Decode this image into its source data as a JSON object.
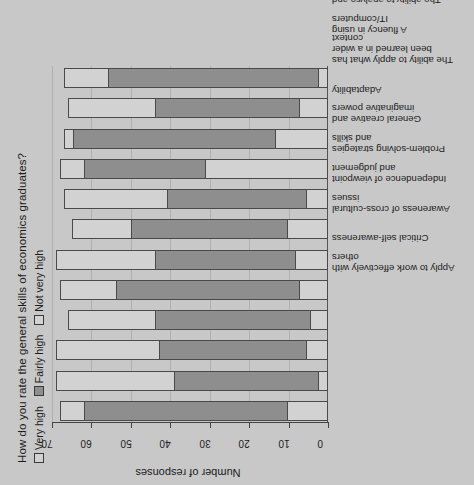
{
  "chart_data": {
    "type": "bar",
    "subtype": "stacked-horizontal",
    "title": "How do you rate the general skills of economics graduates?",
    "xlabel": "",
    "ylabel": "Number of responses",
    "axis_title": "Number of responses",
    "ylim": [
      0,
      70
    ],
    "ticks": [
      0,
      10,
      20,
      30,
      40,
      50,
      60,
      70
    ],
    "grid": true,
    "legend_position": "top-left",
    "legend": [
      "Very high",
      "Fairly high",
      "Not very high"
    ],
    "categories": [
      "Apply to work effectively with others",
      "Critical self-awareness",
      "Awareness of cross-cultural issues",
      "Independence of viewpoint and judgement",
      "Problem-solving strategies and skills",
      "General creative and imaginative powers",
      "Adaptability",
      "The ability to apply what has been learned in a wider context",
      "A fluency in using IT/computers",
      "The ability to analyse and interpret quantitative data",
      "The ability to communicate clearly in writing",
      "The ability to communicate clearly in speech"
    ],
    "series": [
      {
        "name": "Very high",
        "color": "#d2d2d2",
        "values": [
          10,
          2,
          5,
          4,
          7,
          8,
          10,
          5,
          31,
          13,
          7,
          2
        ]
      },
      {
        "name": "Fairly high",
        "color": "#8e8e8e",
        "values": [
          52,
          37,
          38,
          40,
          47,
          36,
          40,
          36,
          31,
          52,
          37,
          54
        ]
      },
      {
        "name": "Not very high",
        "color": "#d2d2d2",
        "values": [
          6,
          30,
          26,
          22,
          14,
          25,
          15,
          26,
          6,
          2,
          22,
          11
        ]
      }
    ],
    "totals": [
      68,
      69,
      69,
      66,
      68,
      69,
      65,
      67,
      68,
      67,
      66,
      67
    ]
  },
  "chart": {
    "title": "How do you rate the general skills of economics graduates?",
    "axis_title": "Number of responses",
    "legend": [
      {
        "label": "Very high",
        "swatch": "#d2d2d2"
      },
      {
        "label": "Fairly high",
        "swatch": "#8e8e8e"
      },
      {
        "label": "Not very high",
        "swatch": "#d2d2d2"
      }
    ]
  },
  "colors": {
    "background": "#c8c8c8",
    "light_segment": "#d2d2d2",
    "dark_segment": "#8e8e8e",
    "outline": "#4a4a4a",
    "text": "#1c1c1c",
    "grid": "#b0b0b0"
  }
}
